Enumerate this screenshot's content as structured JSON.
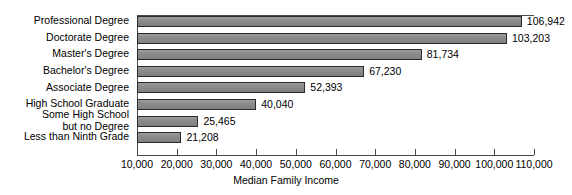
{
  "chart_data": {
    "type": "bar",
    "orientation": "horizontal",
    "title": "",
    "xlabel": "Median Family Income",
    "ylabel": "",
    "xlim": [
      10000,
      110000
    ],
    "xticks": [
      "10,000",
      "20,000",
      "30,000",
      "40,000",
      "50,000",
      "60,000",
      "70,000",
      "80,000",
      "90,000",
      "100,000",
      "110,000"
    ],
    "xtick_values": [
      10000,
      20000,
      30000,
      40000,
      50000,
      60000,
      70000,
      80000,
      90000,
      100000,
      110000
    ],
    "grid": false,
    "legend": "none",
    "bar_baseline": 10000,
    "categories": [
      "Professional Degree",
      "Doctorate Degree",
      "Master's Degree",
      "Bachelor's Degree",
      "Associate Degree",
      "High School Graduate",
      "Some High School\nbut no Degree",
      "Less than Ninth Grade"
    ],
    "values": [
      106942,
      103203,
      81734,
      67230,
      52393,
      40040,
      25465,
      21208
    ],
    "value_labels": [
      "106,942",
      "103,203",
      "81,734",
      "67,230",
      "52,393",
      "40,040",
      "25,465",
      "21,208"
    ],
    "bar_color": "#8c8c8c",
    "bar_border_color": "#2b2b2b",
    "axis_color": "#4a4a4a",
    "background": "#ffffff"
  },
  "category_label_lines": [
    [
      "Professional Degree"
    ],
    [
      "Doctorate Degree"
    ],
    [
      "Master's Degree"
    ],
    [
      "Bachelor's Degree"
    ],
    [
      "Associate Degree"
    ],
    [
      "High School Graduate"
    ],
    [
      "Some High School",
      "but no Degree"
    ],
    [
      "Less than Ninth Grade"
    ]
  ]
}
